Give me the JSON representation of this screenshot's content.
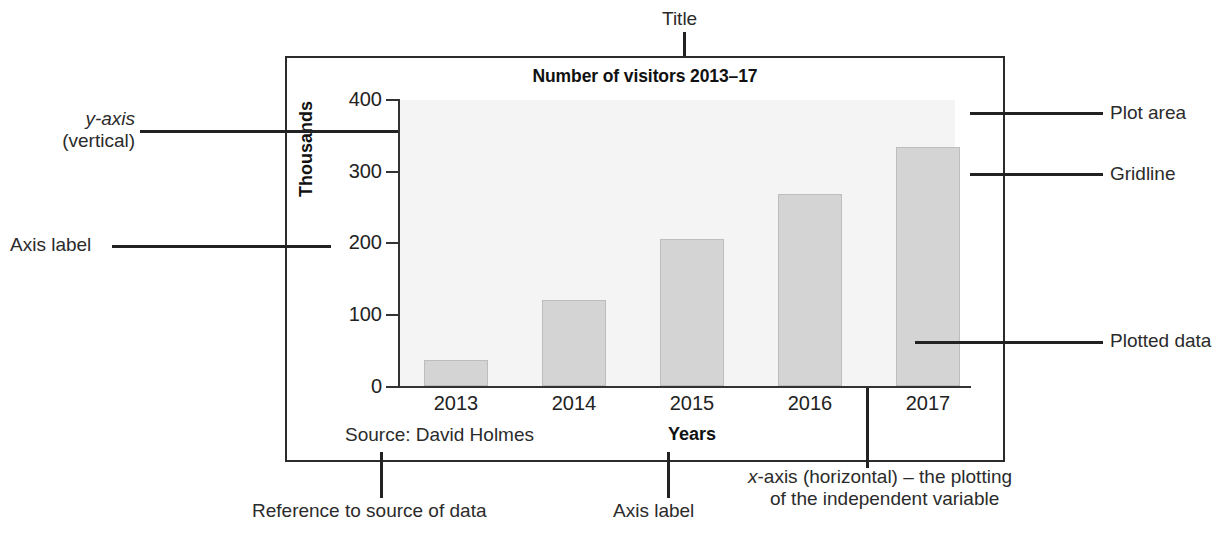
{
  "chart_data": {
    "type": "bar",
    "title": "Number of visitors 2013–17",
    "categories": [
      "2013",
      "2014",
      "2015",
      "2016",
      "2017"
    ],
    "values": [
      36,
      120,
      205,
      268,
      334
    ],
    "xlabel": "Years",
    "ylabel": "Thousands",
    "ylim": [
      0,
      400
    ],
    "ytick_labels": [
      "400",
      "300",
      "200",
      "100",
      "0"
    ],
    "ytick_values": [
      400,
      300,
      200,
      100,
      0
    ],
    "grid": false,
    "legend": null,
    "source_note": "Source: David Holmes",
    "bar_color": "#d4d4d4",
    "plot_area_color": "#f4f4f4",
    "axis_color": "#333333"
  },
  "annotations": {
    "title": "Title",
    "y_axis_line1": "y-axis",
    "y_axis_line2": "(vertical)",
    "axis_label_left": "Axis label",
    "plot_area": "Plot area",
    "gridline": "Gridline",
    "plotted_data": "Plotted data",
    "reference_source": "Reference to source of data",
    "axis_label_bottom": "Axis label",
    "x_axis_line1": "x-axis (horizontal) – the plotting",
    "x_axis_line2": "of the independent variable"
  }
}
